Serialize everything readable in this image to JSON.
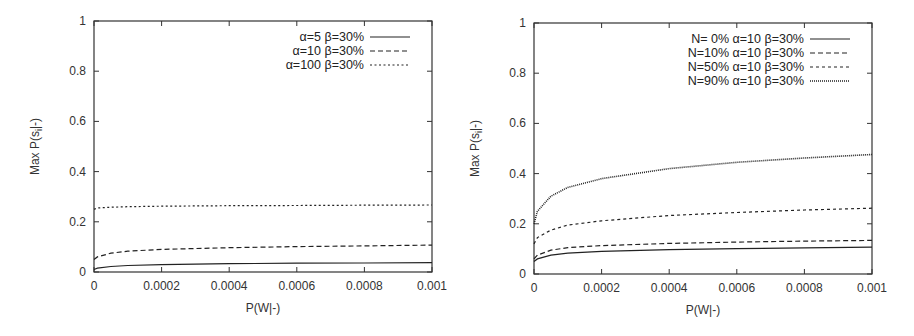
{
  "chart_data": [
    {
      "type": "line",
      "title": "",
      "xlabel": "P(W|-)",
      "ylabel": "Max P(s_i|-)",
      "xlim": [
        0,
        0.001
      ],
      "ylim": [
        0,
        1
      ],
      "xticks": [
        "0",
        "0.0002",
        "0.0004",
        "0.0006",
        "0.0008",
        "0.001"
      ],
      "yticks": [
        "0",
        "0.2",
        "0.4",
        "0.6",
        "0.8",
        "1"
      ],
      "legend_position": "top-right",
      "grid": false,
      "x": [
        0,
        1e-05,
        5e-05,
        0.0001,
        0.0002,
        0.0004,
        0.0006,
        0.0008,
        0.001
      ],
      "series": [
        {
          "name": "α=5 β=30%",
          "style": "solid",
          "values": [
            0.01,
            0.015,
            0.022,
            0.026,
            0.029,
            0.033,
            0.035,
            0.036,
            0.037
          ]
        },
        {
          "name": "α=10 β=30%",
          "style": "dashed",
          "values": [
            0.05,
            0.06,
            0.075,
            0.083,
            0.09,
            0.097,
            0.101,
            0.104,
            0.107
          ]
        },
        {
          "name": "α=100 β=30%",
          "style": "dotted",
          "values": [
            0.25,
            0.255,
            0.258,
            0.26,
            0.262,
            0.264,
            0.265,
            0.266,
            0.267
          ]
        }
      ]
    },
    {
      "type": "line",
      "title": "",
      "xlabel": "P(W|-)",
      "ylabel": "Max P(s_i|-)",
      "xlim": [
        0,
        0.001
      ],
      "ylim": [
        0,
        1
      ],
      "xticks": [
        "0",
        "0.0002",
        "0.0004",
        "0.0006",
        "0.0008",
        "0.001"
      ],
      "yticks": [
        "0",
        "0.2",
        "0.4",
        "0.6",
        "0.8",
        "1"
      ],
      "legend_position": "top-right",
      "grid": false,
      "x": [
        0,
        1e-05,
        5e-05,
        0.0001,
        0.0002,
        0.0004,
        0.0006,
        0.0008,
        0.001
      ],
      "series": [
        {
          "name": "N= 0% α=10 β=30%",
          "style": "solid",
          "values": [
            0.05,
            0.06,
            0.075,
            0.083,
            0.09,
            0.097,
            0.101,
            0.104,
            0.107
          ]
        },
        {
          "name": "N=10% α=10 β=30%",
          "style": "dashed",
          "values": [
            0.06,
            0.075,
            0.095,
            0.105,
            0.113,
            0.122,
            0.127,
            0.131,
            0.134
          ]
        },
        {
          "name": "N=50% α=10 β=30%",
          "style": "short-dashed",
          "values": [
            0.12,
            0.145,
            0.175,
            0.195,
            0.212,
            0.233,
            0.245,
            0.255,
            0.262
          ]
        },
        {
          "name": "N=90% α=10 β=30%",
          "style": "dense-dotted",
          "values": [
            0.2,
            0.25,
            0.31,
            0.345,
            0.38,
            0.42,
            0.445,
            0.462,
            0.476
          ]
        }
      ]
    }
  ]
}
